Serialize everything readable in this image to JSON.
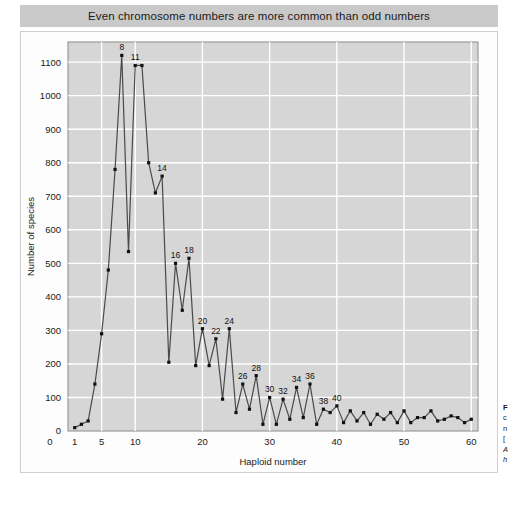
{
  "title": {
    "text": "Even chromosome numbers are more common than odd numbers"
  },
  "caption": {
    "line1": "F",
    "line2": "c",
    "line3": "n",
    "line4": "[",
    "line5": "A",
    "line6": "h"
  },
  "chart_data": {
    "type": "line",
    "title": "Even chromosome numbers are more common than odd numbers",
    "xlabel": "Haploid number",
    "ylabel": "Number of species",
    "xlim": [
      0,
      61
    ],
    "ylim": [
      0,
      1160
    ],
    "xticks": [
      0,
      1,
      5,
      10,
      20,
      30,
      40,
      50,
      60
    ],
    "xtick_labels": [
      "0",
      "1",
      "5",
      "10",
      "20",
      "30",
      "40",
      "50",
      "60"
    ],
    "yticks": [
      0,
      100,
      200,
      300,
      400,
      500,
      600,
      700,
      800,
      900,
      1000,
      1100
    ],
    "ytick_labels": [
      "0",
      "100",
      "200",
      "300",
      "400",
      "500",
      "600",
      "700",
      "800",
      "900",
      "1000",
      "1100"
    ],
    "grid": true,
    "legend": "none",
    "marker": "square",
    "line_color": "#4a4a4a",
    "marker_color": "#111111",
    "plot_background": "#d6d6d6",
    "grid_color": "#ffffff",
    "x": [
      1,
      2,
      3,
      4,
      5,
      6,
      7,
      8,
      9,
      10,
      11,
      12,
      13,
      14,
      15,
      16,
      17,
      18,
      19,
      20,
      21,
      22,
      23,
      24,
      25,
      26,
      27,
      28,
      29,
      30,
      31,
      32,
      33,
      34,
      35,
      36,
      37,
      38,
      39,
      40,
      41,
      42,
      43,
      44,
      45,
      46,
      47,
      48,
      49,
      50,
      51,
      52,
      53,
      54,
      55,
      56,
      57,
      58,
      59,
      60
    ],
    "values": [
      10,
      20,
      30,
      140,
      290,
      480,
      780,
      1120,
      535,
      1090,
      1090,
      800,
      710,
      760,
      205,
      500,
      360,
      515,
      195,
      305,
      195,
      275,
      95,
      305,
      55,
      140,
      65,
      165,
      20,
      100,
      20,
      95,
      35,
      130,
      40,
      140,
      20,
      65,
      55,
      75,
      25,
      60,
      30,
      55,
      20,
      50,
      35,
      55,
      25,
      60,
      25,
      40,
      40,
      60,
      30,
      35,
      45,
      40,
      25,
      35
    ],
    "point_labels": [
      {
        "x": 8,
        "y": 1120,
        "label": "8"
      },
      {
        "x": 10,
        "y": 1090,
        "label": "11"
      },
      {
        "x": 14,
        "y": 760,
        "label": "14"
      },
      {
        "x": 16,
        "y": 500,
        "label": "16"
      },
      {
        "x": 18,
        "y": 515,
        "label": "18"
      },
      {
        "x": 20,
        "y": 305,
        "label": "20"
      },
      {
        "x": 22,
        "y": 275,
        "label": "22"
      },
      {
        "x": 24,
        "y": 305,
        "label": "24"
      },
      {
        "x": 26,
        "y": 140,
        "label": "26"
      },
      {
        "x": 28,
        "y": 165,
        "label": "28"
      },
      {
        "x": 30,
        "y": 100,
        "label": "30"
      },
      {
        "x": 32,
        "y": 95,
        "label": "32"
      },
      {
        "x": 34,
        "y": 130,
        "label": "34"
      },
      {
        "x": 36,
        "y": 140,
        "label": "36"
      },
      {
        "x": 38,
        "y": 65,
        "label": "38"
      },
      {
        "x": 40,
        "y": 75,
        "label": "40"
      }
    ]
  }
}
